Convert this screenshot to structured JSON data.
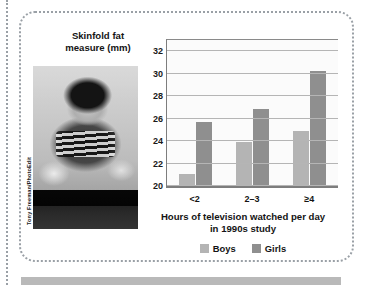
{
  "figure": {
    "photo": {
      "credit": "Tony Freeman/PhotoEdit",
      "description": "Black and white photo of a teenager eating snacks while sitting on a couch watching television"
    }
  },
  "chart_data": {
    "type": "bar",
    "title": "",
    "xlabel": "Hours of television watched per day in 1990s study",
    "xlabel_line1": "Hours of television watched per day",
    "xlabel_line2": "in 1990s study",
    "ylabel": "Skinfold fat measure (mm)",
    "ylabel_line1": "Skinfold fat",
    "ylabel_line2": "measure (mm)",
    "categories": [
      "<2",
      "2–3",
      "≥4"
    ],
    "series": [
      {
        "name": "Boys",
        "values": [
          21.1,
          23.9,
          24.9
        ],
        "color": "#b4b4b4"
      },
      {
        "name": "Girls",
        "values": [
          25.7,
          26.9,
          30.2
        ],
        "color": "#8f8f8f"
      }
    ],
    "ylim": [
      20,
      33
    ],
    "yticks": [
      20,
      22,
      24,
      26,
      28,
      30,
      32
    ],
    "grid": true,
    "legend_position": "bottom"
  }
}
